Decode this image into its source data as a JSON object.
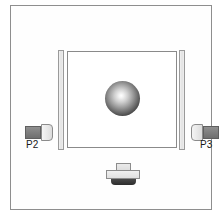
{
  "diagram": {
    "background_color": "#ffffff",
    "frame": {
      "name": "outer-enclosure",
      "border_color": "#8e8e8e",
      "fill_color": "#fefefe"
    },
    "chamber": {
      "name": "inner-chamber",
      "border_color": "#8a8a8a",
      "fill_color": "#ffffff"
    },
    "plates": [
      {
        "id": "left-plate",
        "side": "left",
        "fill_color": "#e2e2e2",
        "border_color": "#9a9a9a"
      },
      {
        "id": "right-plate",
        "side": "right",
        "fill_color": "#e2e2e2",
        "border_color": "#9a9a9a"
      }
    ],
    "sphere": {
      "name": "central-sphere",
      "highlight_color": "#ffffff",
      "edge_color": "#0a0a0a"
    },
    "ports": [
      {
        "id": "port-left",
        "label": "P2",
        "side": "left",
        "dark_color": "#7d7d7d",
        "light_color": "#e6e6e6"
      },
      {
        "id": "port-right",
        "label": "P3",
        "side": "right",
        "dark_color": "#7d7d7d",
        "light_color": "#e6e6e6"
      }
    ],
    "mount": {
      "name": "bottom-mount",
      "cap_color": "#dedede",
      "body_color": "#e0e0e0",
      "base_color": "#2c2c2c"
    }
  }
}
